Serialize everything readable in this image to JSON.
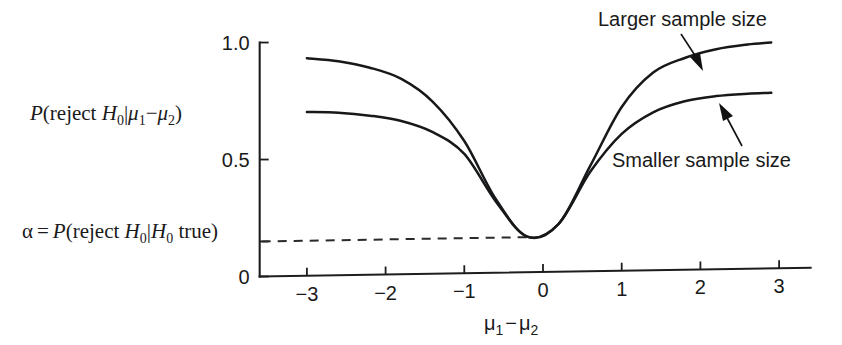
{
  "figure": {
    "background_color": "#ffffff",
    "ink_color": "#16181a"
  },
  "axes": {
    "y_label_parts": {
      "p": "P",
      "open": "(reject ",
      "h": "H",
      "h_sub": "0",
      "bar": "|",
      "mu1": "μ",
      "mu1_sub": "1",
      "minus": "−",
      "mu2": "μ",
      "mu2_sub": "2",
      "close": ")"
    },
    "y_ticks": [
      {
        "label": "1.0",
        "value": 1.0
      },
      {
        "label": "0.5",
        "value": 0.5
      },
      {
        "label": "0",
        "value": 0.0
      }
    ],
    "x_ticks": [
      {
        "label": "−3",
        "value": -3
      },
      {
        "label": "−2",
        "value": -2
      },
      {
        "label": "−1",
        "value": -1
      },
      {
        "label": "0",
        "value": 0
      },
      {
        "label": "1",
        "value": 1
      },
      {
        "label": "2",
        "value": 2
      },
      {
        "label": "3",
        "value": 3
      }
    ],
    "x_title_parts": {
      "mu1": "μ",
      "mu1_sub": "1",
      "minus": "−",
      "mu2": "μ",
      "mu2_sub": "2"
    },
    "x_range": [
      -3.6,
      3.4
    ],
    "y_range": [
      0.0,
      1.08
    ]
  },
  "alpha_label": {
    "alpha": "α",
    "equals": "=",
    "p": "P",
    "open": "(reject ",
    "h1": "H",
    "h1_sub": "0",
    "bar": "|",
    "h2": "H",
    "h2_sub": "0",
    "true_text": " true)",
    "value": 0.15
  },
  "annotations": [
    {
      "name": "larger-sample-size",
      "text": "Larger sample size",
      "points_to_curve": "larger"
    },
    {
      "name": "smaller-sample-size",
      "text": "Smaller sample size",
      "points_to_curve": "smaller"
    }
  ],
  "chart_data": {
    "type": "line",
    "title": "",
    "xlabel": "μ1−μ2",
    "ylabel": "P(reject H0 | μ1−μ2)",
    "xlim": [
      -3.6,
      3.4
    ],
    "ylim": [
      0.0,
      1.08
    ],
    "grid": false,
    "legend": "annotated-arrows",
    "alpha_level": 0.15,
    "x": [
      -3.0,
      -2.6,
      -2.2,
      -1.8,
      -1.4,
      -1.0,
      -0.6,
      -0.2,
      0.2,
      0.6,
      1.0,
      1.4,
      1.8,
      2.2,
      2.6,
      2.9
    ],
    "series": [
      {
        "name": "Larger sample size",
        "values": [
          0.93,
          0.915,
          0.885,
          0.835,
          0.735,
          0.565,
          0.315,
          0.152,
          0.205,
          0.45,
          0.7,
          0.845,
          0.905,
          0.94,
          0.958,
          0.965
        ]
      },
      {
        "name": "Smaller sample size",
        "values": [
          0.7,
          0.695,
          0.68,
          0.655,
          0.605,
          0.51,
          0.305,
          0.152,
          0.205,
          0.425,
          0.585,
          0.675,
          0.72,
          0.74,
          0.748,
          0.75
        ]
      }
    ]
  }
}
